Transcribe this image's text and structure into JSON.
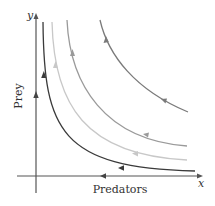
{
  "diagram": {
    "type": "phase-portrait",
    "axes": {
      "x_letter": "x",
      "y_letter": "y",
      "x_label": "Predators",
      "y_label": "Prey"
    },
    "colors": {
      "axis": "#555555",
      "curve_1": "#3a3a3a",
      "curve_2": "#c8c8c8",
      "curve_3": "#9a9a9a",
      "curve_4": "#7a7a7a"
    },
    "trajectories": [
      {
        "name": "trajectory-1",
        "shade": "dark",
        "direction_up_left": "up along y, left along x"
      },
      {
        "name": "trajectory-2",
        "shade": "light",
        "direction_up_left": "up along y, left along x"
      },
      {
        "name": "trajectory-3",
        "shade": "medium",
        "direction_up_left": "up along y, left along x"
      },
      {
        "name": "trajectory-4",
        "shade": "medium-dark",
        "direction_up_left": "up along y, left along x"
      }
    ]
  }
}
